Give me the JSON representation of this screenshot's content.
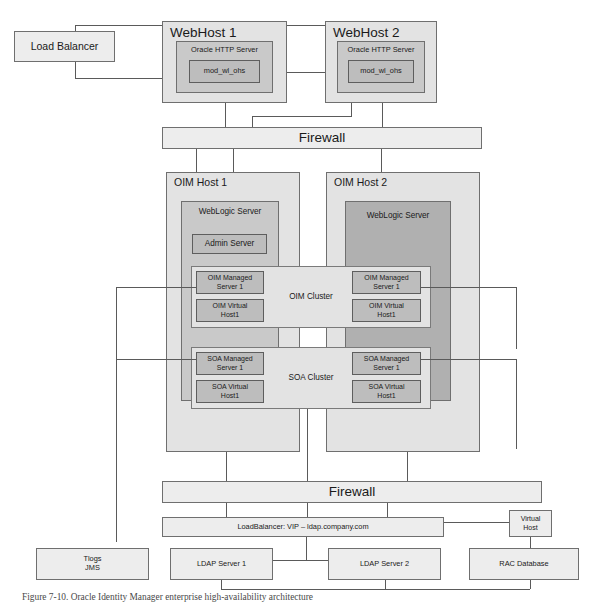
{
  "diagram": {
    "title": "Oracle Identity Manager enterprise high-availability architecture",
    "caption": "Figure 7-10. Oracle Identity Manager enterprise high-availability architecture",
    "colors": {
      "border": "#6f6f6f",
      "fill_light": "#ededed",
      "fill_mid": "#c9c9c9",
      "fill_dark": "#b0b0b0",
      "line": "#5a5a5a",
      "background": "#ffffff"
    }
  },
  "tier_web": {
    "load_balancer": "Load Balancer",
    "webhost1": {
      "title": "WebHost 1",
      "http_server": "Oracle HTTP Server",
      "module": "mod_wl_ohs"
    },
    "webhost2": {
      "title": "WebHost 2",
      "http_server": "Oracle HTTP Server",
      "module": "mod_wl_ohs"
    }
  },
  "firewall_top": "Firewall",
  "tier_app": {
    "oimhost1": {
      "title": "OIM Host 1",
      "weblogic": "WebLogic Server",
      "admin_server": "Admin Server",
      "oim_managed": "OIM Managed\nServer 1",
      "oim_managed_line1": "OIM Managed",
      "oim_managed_line2": "Server 1",
      "oim_virtual_line1": "OIM Virtual",
      "oim_virtual_line2": "Host1",
      "soa_managed_line1": "SOA Managed",
      "soa_managed_line2": "Server 1",
      "soa_virtual_line1": "SOA Virtual",
      "soa_virtual_line2": "Host1"
    },
    "oimhost2": {
      "title": "OIM Host 2",
      "weblogic": "WebLogic Server",
      "oim_managed_line1": "OIM Managed",
      "oim_managed_line2": "Server 1",
      "oim_virtual_line1": "OIM Virtual",
      "oim_virtual_line2": "Host1",
      "soa_managed_line1": "SOA Managed",
      "soa_managed_line2": "Server 1",
      "soa_virtual_line1": "SOA Virtual",
      "soa_virtual_line2": "Host1"
    },
    "oim_cluster": "OIM Cluster",
    "soa_cluster": "SOA Cluster"
  },
  "firewall_bottom": "Firewall",
  "tier_data": {
    "load_balancer_vip": "LoadBalancer: VIP – ldap.company.com",
    "virtual_host_line1": "Virtual",
    "virtual_host_line2": "Host",
    "tlogs_line1": "Tlogs",
    "tlogs_line2": "JMS",
    "ldap_server_1": "LDAP Server 1",
    "ldap_server_2": "LDAP Server 2",
    "rac_database": "RAC Database"
  }
}
